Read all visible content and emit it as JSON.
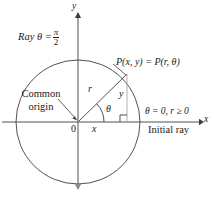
{
  "figure": {
    "colors": {
      "stroke": "#3d3d3d",
      "axis": "#3d3d3d",
      "circle": "#3d3d3d",
      "guide": "#9a9a9a",
      "text": "#1a1a1a",
      "background": "#ffffff"
    }
  },
  "labels": {
    "ray_theta_prefix": "Ray θ =",
    "ray_theta_numerator": "π",
    "ray_theta_denominator": "2",
    "y_axis": "y",
    "x_axis": "x",
    "point_p": "P(x, y) = P(r, θ)",
    "common_origin_line1": "Common",
    "common_origin_line2": "origin",
    "origin_zero": "0",
    "radius_r": "r",
    "angle_theta": "θ",
    "segment_x": "x",
    "segment_y": "y",
    "theta_zero_condition": "θ = 0, r ≥ 0",
    "initial_ray": "Initial ray"
  },
  "geometry": {
    "origin": {
      "x": 78,
      "y": 122
    },
    "circle_radius": 62,
    "point_p": {
      "x": 127,
      "y": 74
    },
    "angle_degrees": 44,
    "x_axis_start": {
      "x": 2,
      "y": 122
    },
    "x_axis_end": {
      "x": 202,
      "y": 122
    },
    "y_axis_top": {
      "x": 78,
      "y": 10
    },
    "y_axis_bottom": {
      "x": 78,
      "y": 192
    },
    "right_angle_size": 7
  }
}
